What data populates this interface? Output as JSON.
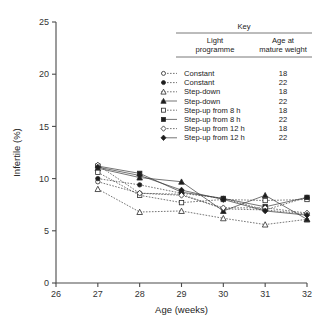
{
  "chart_data": {
    "type": "line",
    "title": "",
    "xlabel": "Age (weeks)",
    "ylabel": "Infertile (%)",
    "xlim": [
      26,
      32
    ],
    "ylim": [
      0,
      25
    ],
    "xticks": [
      26,
      27,
      28,
      29,
      30,
      31,
      32
    ],
    "yticks": [
      0,
      5,
      10,
      15,
      20,
      25
    ],
    "x": [
      27,
      28,
      29,
      30,
      31,
      32
    ],
    "grid": false,
    "legend_position": "upper-right",
    "series": [
      {
        "name": "Constant 18",
        "light_programme": "Constant",
        "age_at_mature_weight": "18",
        "marker": "circle-open",
        "linestyle": "dotted",
        "values": [
          9.7,
          8.6,
          8.5,
          7.1,
          7.0,
          6.6
        ]
      },
      {
        "name": "Constant 22",
        "light_programme": "Constant",
        "age_at_mature_weight": "22",
        "marker": "circle-filled",
        "linestyle": "dotted",
        "values": [
          10.0,
          9.4,
          8.6,
          8.1,
          7.0,
          8.2
        ]
      },
      {
        "name": "Step-down 18",
        "light_programme": "Step-down",
        "age_at_mature_weight": "18",
        "marker": "triangle-open",
        "linestyle": "dotted",
        "values": [
          9.0,
          6.8,
          6.9,
          6.2,
          5.6,
          6.1
        ]
      },
      {
        "name": "Step-down 22",
        "light_programme": "Step-down",
        "age_at_mature_weight": "22",
        "marker": "triangle-filled",
        "linestyle": "solid",
        "values": [
          11.0,
          10.1,
          9.7,
          6.9,
          8.4,
          6.1
        ]
      },
      {
        "name": "Step-up from 8 h 18",
        "light_programme": "Step-up from 8 h",
        "age_at_mature_weight": "18",
        "marker": "square-open",
        "linestyle": "dotted",
        "values": [
          10.6,
          8.4,
          7.7,
          8.0,
          7.9,
          8.0
        ]
      },
      {
        "name": "Step-up from 8 h 22",
        "light_programme": "Step-up from 8 h",
        "age_at_mature_weight": "22",
        "marker": "square-filled",
        "linestyle": "solid",
        "values": [
          11.2,
          10.5,
          8.7,
          8.1,
          7.3,
          8.2
        ]
      },
      {
        "name": "Step-up from 12 h 18",
        "light_programme": "Step-up from 12 h",
        "age_at_mature_weight": "18",
        "marker": "diamond-open",
        "linestyle": "dotted",
        "values": [
          11.3,
          8.6,
          8.4,
          7.2,
          7.2,
          6.7
        ]
      },
      {
        "name": "Step-up from 12 h 22",
        "light_programme": "Step-up from 12 h",
        "age_at_mature_weight": "22",
        "marker": "diamond-filled",
        "linestyle": "solid",
        "values": [
          11.1,
          10.3,
          8.9,
          8.0,
          6.9,
          6.5
        ]
      }
    ]
  },
  "axes": {
    "x_title": "Age (weeks)",
    "y_title": "Infertile (%)",
    "x_tick_labels": [
      "26",
      "27",
      "28",
      "29",
      "30",
      "31",
      "32"
    ],
    "y_tick_labels": [
      "0",
      "5",
      "10",
      "15",
      "20",
      "25"
    ]
  },
  "key": {
    "title": "Key",
    "col1_line1": "Light",
    "col1_line2": "programme",
    "col2_line1": "Age at",
    "col2_line2": "mature weight",
    "rows": [
      {
        "label": "Constant",
        "value": "18"
      },
      {
        "label": "Constant",
        "value": "22"
      },
      {
        "label": "Step-down",
        "value": "18"
      },
      {
        "label": "Step-down",
        "value": "22"
      },
      {
        "label": "Step-up from 8 h",
        "value": "18"
      },
      {
        "label": "Step-up from 8 h",
        "value": "22"
      },
      {
        "label": "Step-up from 12 h",
        "value": "18"
      },
      {
        "label": "Step-up from 12 h",
        "value": "22"
      }
    ]
  },
  "colors": {
    "ink": "#2b2b2b",
    "axis": "#4a4a4a",
    "background": "#ffffff"
  }
}
